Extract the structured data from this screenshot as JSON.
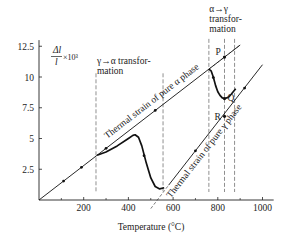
{
  "chart_data": {
    "type": "line",
    "title": "",
    "xlabel": "Temperature (°C)",
    "ylabel_main": "Δl",
    "ylabel_denominator": "l",
    "ylabel_suffix": "×10³",
    "xlim": [
      0,
      1050
    ],
    "ylim": [
      0,
      13
    ],
    "x_ticks": [
      200,
      400,
      600,
      800,
      1000
    ],
    "x_minor_ticks": [
      100,
      300,
      500,
      700,
      900
    ],
    "y_ticks": [
      2.5,
      5,
      7.5,
      10,
      12.5
    ],
    "grid": false,
    "series": [
      {
        "name": "Thermal strain of pure α phase",
        "style": "solid-thin",
        "x": [
          0,
          900
        ],
        "y": [
          0,
          12.6
        ]
      },
      {
        "name": "Thermal strain of pure α phase (extrapolated)",
        "style": "dashed-thin",
        "x": [
          760,
          900
        ],
        "y": [
          10.64,
          12.6
        ]
      },
      {
        "name": "Thermal strain of pure γ phase",
        "style": "solid-thin",
        "x": [
          580,
          1000
        ],
        "y": [
          1.2,
          11.0
        ]
      },
      {
        "name": "Thermal strain of pure γ phase (extrapolated)",
        "style": "dashed-thin",
        "x": [
          500,
          580
        ],
        "y": [
          -0.7,
          1.2
        ]
      },
      {
        "name": "Measured cooling curve",
        "style": "solid-thick",
        "x": [
          560,
          540,
          520,
          500,
          480,
          460,
          445,
          430,
          420,
          400,
          350,
          300,
          260
        ],
        "y": [
          1.0,
          0.9,
          1.1,
          1.8,
          3.0,
          4.4,
          5.1,
          5.3,
          5.25,
          5.0,
          4.4,
          3.9,
          3.64
        ]
      },
      {
        "name": "Measured heating curve",
        "style": "solid-thick",
        "x": [
          760,
          770,
          780,
          790,
          800,
          810,
          820,
          830,
          840,
          850,
          860,
          880
        ],
        "y": [
          10.64,
          10.5,
          10.0,
          9.3,
          8.8,
          8.5,
          8.3,
          8.25,
          8.3,
          8.4,
          8.6,
          9.05
        ]
      }
    ],
    "markers": [
      {
        "label": "P",
        "x": 830,
        "y": 11.62
      },
      {
        "label": "Q",
        "x": 830,
        "y": 8.25
      },
      {
        "label": "R",
        "x": 830,
        "y": 6.8
      }
    ],
    "direction_arrows": [
      {
        "x": 110,
        "y": 1.54
      },
      {
        "x": 190,
        "y": 2.66
      },
      {
        "x": 300,
        "y": 4.2
      },
      {
        "x": 520,
        "y": 7.28
      },
      {
        "x": 470,
        "y": 3.6
      },
      {
        "x": 780,
        "y": 9.95
      },
      {
        "x": 700,
        "y": 4.0
      },
      {
        "x": 920,
        "y": 9.1
      }
    ],
    "annotations": [
      {
        "id": "gamma-to-alpha",
        "lines": [
          "γ→α transfor-",
          "mation"
        ],
        "dashed_x": [
          255,
          555
        ]
      },
      {
        "id": "alpha-to-gamma",
        "lines": [
          "α→γ",
          "transfor-",
          "mation"
        ],
        "dashed_x": [
          760,
          830,
          875
        ]
      }
    ],
    "line_labels": {
      "alpha": "Thermal strain of pure α phase",
      "gamma": "Thermal strain of pure γ phase"
    }
  }
}
